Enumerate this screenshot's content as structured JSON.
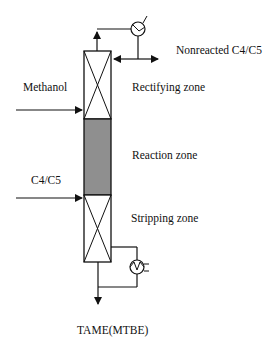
{
  "diagram": {
    "colors": {
      "line": "#111111",
      "reaction_zone_fill": "#8f8f8f",
      "background": "#ffffff"
    },
    "labels": {
      "nonreacted": "Nonreacted C4/C5",
      "methanol": "Methanol",
      "rectifying": "Rectifying zone",
      "reaction": "Reaction zone",
      "c4c5": "C4/C5",
      "stripping": "Stripping zone",
      "product": "TAME(MTBE)"
    },
    "zones": [
      {
        "name": "Rectifying zone",
        "type": "packed"
      },
      {
        "name": "Reaction zone",
        "type": "catalytic"
      },
      {
        "name": "Stripping zone",
        "type": "packed"
      }
    ],
    "equipment": [
      {
        "name": "condenser",
        "icon": "condenser-icon"
      },
      {
        "name": "reboiler",
        "icon": "reboiler-icon"
      }
    ],
    "streams": [
      {
        "name": "Methanol",
        "direction": "in"
      },
      {
        "name": "C4/C5",
        "direction": "in"
      },
      {
        "name": "Nonreacted C4/C5",
        "direction": "out"
      },
      {
        "name": "TAME(MTBE)",
        "direction": "out"
      }
    ]
  }
}
